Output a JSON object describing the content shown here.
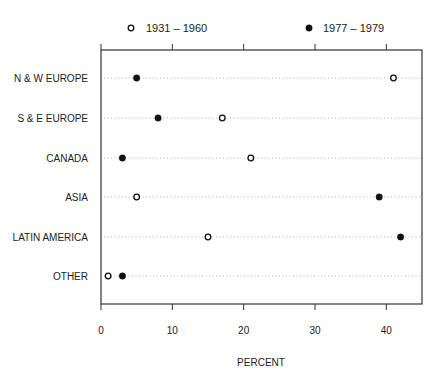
{
  "chart_data": {
    "type": "scatter",
    "subtype": "dot-plot",
    "title": "",
    "xlabel": "PERCENT",
    "ylabel": "",
    "xlim": [
      0,
      45
    ],
    "xticks": [
      0,
      10,
      20,
      30,
      40
    ],
    "grid": "dotted horizontal lines per category",
    "legend_position": "top",
    "categories": [
      "N & W EUROPE",
      "S & E EUROPE",
      "CANADA",
      "ASIA",
      "LATIN AMERICA",
      "OTHER"
    ],
    "series": [
      {
        "name": "1931 – 1960",
        "marker": "open-circle",
        "values": [
          41,
          17,
          21,
          5,
          15,
          1
        ]
      },
      {
        "name": "1977 – 1979",
        "marker": "filled-circle",
        "values": [
          5,
          8,
          3,
          39,
          42,
          3
        ]
      }
    ]
  },
  "colors": {
    "axis": "#333333",
    "marker": "#111111",
    "grid": "#888888",
    "background": "#ffffff"
  }
}
